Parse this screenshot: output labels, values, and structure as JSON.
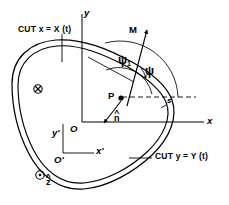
{
  "figure": {
    "width": 229,
    "height": 205,
    "background": "#ffffff",
    "ink": "#000000"
  },
  "axes": {
    "primary": {
      "origin_label": "O",
      "x_label": "x",
      "y_label": "y",
      "origin_px": [
        82,
        122
      ],
      "x_end_px": [
        206,
        122
      ],
      "y_end_px": [
        82,
        14
      ]
    },
    "secondary": {
      "origin_label": "O'",
      "x_label": "x'",
      "y_label": "y'",
      "origin_px": [
        63,
        153
      ],
      "x_end_px": [
        96,
        153
      ],
      "y_end_px": [
        63,
        122
      ]
    }
  },
  "labels": {
    "cut_x": "CUT x = X (t)",
    "cut_y": "CUT y = Y (t)",
    "point_p": "P",
    "moment": "M",
    "arc_length": "s",
    "normal": "n",
    "normal_accent": "^",
    "z_axis": "z",
    "z_accent": "^",
    "psi": "ψ",
    "psi_one": "ψ",
    "psi_one_subscript": "1"
  },
  "markers": {
    "into_page": {
      "name": "cross-in-circle",
      "glyph": "⊗",
      "meaning": "vector into page",
      "center_px": [
        38,
        89
      ],
      "radius_px": 4.2
    },
    "out_of_page": {
      "name": "dot-in-circle",
      "glyph": "⊙",
      "meaning": "vector out of page",
      "center_px": [
        40,
        175
      ],
      "radius_px": 4.2
    }
  },
  "geometry": {
    "point_p_px": [
      120,
      97
    ],
    "cut_x_tick_px": [
      62,
      36,
      62,
      62
    ],
    "cut_y_leader_px": [
      131,
      158,
      152,
      158
    ],
    "dashed_ref_line_px": [
      120,
      97,
      196,
      97
    ],
    "moment_arrow_px": [
      127,
      105,
      146,
      31
    ],
    "normal_arrow_px": [
      122,
      100,
      104,
      124
    ],
    "psi_arc_radius_px": 44,
    "psi1_arc_radius_px": 28
  },
  "style": {
    "stroke_width_curve": 1.2,
    "stroke_width_axis": 1.0,
    "stroke_width_thin": 0.8
  }
}
